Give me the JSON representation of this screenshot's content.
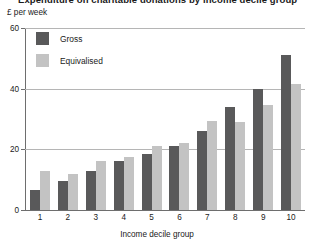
{
  "title_sliver": "Expenditure on charitable donations by income decile group",
  "chart_data": {
    "type": "bar",
    "title": "",
    "ylabel": "£ per week",
    "xlabel": "Income decile group",
    "categories": [
      "1",
      "2",
      "3",
      "4",
      "5",
      "6",
      "7",
      "8",
      "9",
      "10"
    ],
    "ylim": [
      0,
      60
    ],
    "yticks": [
      0,
      20,
      40,
      60
    ],
    "ytick_labels": [
      "0",
      "20",
      "40",
      "60"
    ],
    "grid": "horizontal",
    "legend_position": "top-left",
    "series": [
      {
        "name": "Gross",
        "color": "#59595a",
        "values": [
          6.5,
          9.5,
          13,
          16,
          18.5,
          21,
          26,
          34,
          40,
          51
        ]
      },
      {
        "name": "Equivalised",
        "color": "#c3c3c3",
        "values": [
          13,
          12,
          16,
          17.5,
          21,
          22,
          29.5,
          29,
          34.5,
          41.5
        ]
      }
    ]
  }
}
